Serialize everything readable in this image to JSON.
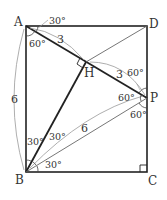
{
  "diagram": {
    "type": "geometry-rectangle",
    "colors": {
      "line": "#222222",
      "thin": "#888888",
      "text": "#333333"
    },
    "points": {
      "A": {
        "label": "A"
      },
      "B": {
        "label": "B"
      },
      "C": {
        "label": "C"
      },
      "D": {
        "label": "D"
      },
      "H": {
        "label": "H"
      },
      "P": {
        "label": "P"
      }
    },
    "lengths": {
      "AB": "6",
      "AH": "3",
      "HP": "3",
      "BP": "6"
    },
    "angles": {
      "A_top": "30°",
      "A_inner": "60°",
      "P_top": "60°",
      "P_left": "60°",
      "P_bottom": "60°",
      "B_left": "30°",
      "B_mid": "30°",
      "B_bottom": "30°"
    }
  }
}
